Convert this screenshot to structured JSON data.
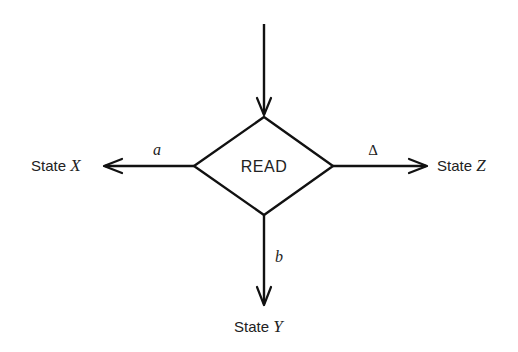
{
  "diagram": {
    "decision_node": {
      "label": "READ",
      "shape": "diamond"
    },
    "states": {
      "x": {
        "prefix": "State ",
        "var": "X"
      },
      "y": {
        "prefix": "State ",
        "var": "Y"
      },
      "z": {
        "prefix": "State ",
        "var": "Z"
      }
    },
    "edges": {
      "entry": {
        "label": ""
      },
      "to_x": {
        "label": "a"
      },
      "to_y": {
        "label": "b"
      },
      "to_z": {
        "label": "Δ"
      }
    },
    "colors": {
      "stroke": "#111111",
      "text": "#222222",
      "background": "#ffffff"
    }
  }
}
